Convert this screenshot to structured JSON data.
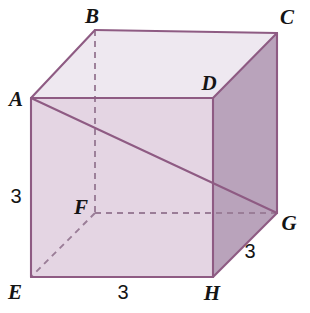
{
  "figure": {
    "shape": "cube",
    "projection": "oblique",
    "width": 310,
    "height": 313,
    "background_color": "#ffffff"
  },
  "colors": {
    "top_face": "#eee8f0",
    "front_face": "#e4d5e3",
    "right_face": "#b9a3bb",
    "edge_stroke": "#8e5b83",
    "hidden_edge_stroke": "#9a7d97",
    "label_text": "#141414"
  },
  "vertices": [
    {
      "name": "A",
      "x": 31,
      "y": 98,
      "label": "A",
      "label_x": 16,
      "label_y": 99,
      "hidden": false
    },
    {
      "name": "B",
      "x": 95,
      "y": 30,
      "label": "B",
      "label_x": 92,
      "label_y": 16,
      "hidden": false
    },
    {
      "name": "C",
      "x": 277,
      "y": 33,
      "label": "C",
      "label_x": 287,
      "label_y": 17,
      "hidden": false
    },
    {
      "name": "D",
      "x": 213,
      "y": 98,
      "label": "D",
      "label_x": 209,
      "label_y": 83,
      "hidden": false
    },
    {
      "name": "E",
      "x": 31,
      "y": 277,
      "label": "E",
      "label_x": 15,
      "label_y": 292,
      "hidden": false
    },
    {
      "name": "F",
      "x": 95,
      "y": 213,
      "label": "F",
      "label_x": 81,
      "label_y": 207,
      "hidden": true
    },
    {
      "name": "G",
      "x": 277,
      "y": 213,
      "label": "G",
      "label_x": 289,
      "label_y": 223,
      "hidden": false
    },
    {
      "name": "H",
      "x": 213,
      "y": 277,
      "label": "H",
      "label_x": 212,
      "label_y": 293,
      "hidden": false
    }
  ],
  "faces": [
    {
      "name": "top-face",
      "polygon": "31,98 95,30 277,33 213,98",
      "fill": "#eee8f0"
    },
    {
      "name": "front-face",
      "polygon": "31,98 213,98 213,277 31,277",
      "fill": "#e4d5e3"
    },
    {
      "name": "right-face",
      "polygon": "213,98 277,33 277,213 213,277",
      "fill": "#b9a3bb"
    }
  ],
  "solid_edges": [
    {
      "name": "edge-A-B",
      "from": "A",
      "to": "B"
    },
    {
      "name": "edge-B-C",
      "from": "B",
      "to": "C"
    },
    {
      "name": "edge-C-D",
      "from": "C",
      "to": "D"
    },
    {
      "name": "edge-D-A",
      "from": "D",
      "to": "A"
    },
    {
      "name": "edge-A-E",
      "from": "A",
      "to": "E"
    },
    {
      "name": "edge-D-H",
      "from": "D",
      "to": "H"
    },
    {
      "name": "edge-C-G",
      "from": "C",
      "to": "G"
    },
    {
      "name": "edge-E-H",
      "from": "E",
      "to": "H"
    },
    {
      "name": "edge-H-G",
      "from": "H",
      "to": "G"
    },
    {
      "name": "edge-G-D",
      "from": "G",
      "to": "D"
    }
  ],
  "hidden_edges": [
    {
      "name": "hidden-edge-B-F",
      "from": "B",
      "to": "F"
    },
    {
      "name": "hidden-edge-F-G",
      "from": "F",
      "to": "G"
    },
    {
      "name": "hidden-edge-F-E",
      "from": "F",
      "to": "E"
    }
  ],
  "diagonals": [
    {
      "name": "diagonal-A-G",
      "from": "A",
      "to": "G",
      "style": "solid"
    }
  ],
  "measurements": [
    {
      "name": "height-label",
      "value": "3",
      "x": 16,
      "y": 196,
      "edge": "AE"
    },
    {
      "name": "bottom-label",
      "value": "3",
      "x": 123,
      "y": 292,
      "edge": "EH"
    },
    {
      "name": "depth-label",
      "value": "3",
      "x": 250,
      "y": 251,
      "edge": "HG"
    }
  ]
}
